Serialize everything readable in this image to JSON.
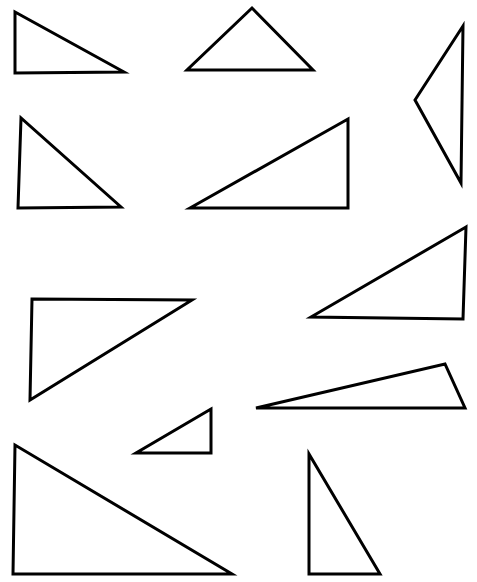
{
  "diagram": {
    "background": "#ffffff",
    "stroke_color": "#000000",
    "stroke_width": 3,
    "triangles": [
      {
        "id": "t1",
        "points": [
          [
            15,
            12
          ],
          [
            15,
            73
          ],
          [
            124,
            72
          ]
        ]
      },
      {
        "id": "t2",
        "points": [
          [
            252,
            8
          ],
          [
            187,
            70
          ],
          [
            313,
            70
          ]
        ]
      },
      {
        "id": "t3",
        "points": [
          [
            463,
            26
          ],
          [
            415,
            100
          ],
          [
            461,
            183
          ]
        ]
      },
      {
        "id": "t4",
        "points": [
          [
            21,
            118
          ],
          [
            18,
            208
          ],
          [
            121,
            207
          ]
        ]
      },
      {
        "id": "t5",
        "points": [
          [
            190,
            208
          ],
          [
            348,
            119
          ],
          [
            348,
            208
          ]
        ]
      },
      {
        "id": "t6",
        "points": [
          [
            466,
            227
          ],
          [
            311,
            317
          ],
          [
            463,
            319
          ]
        ]
      },
      {
        "id": "t7",
        "points": [
          [
            32,
            299
          ],
          [
            192,
            300
          ],
          [
            30,
            400
          ]
        ]
      },
      {
        "id": "t8",
        "points": [
          [
            256,
            408
          ],
          [
            445,
            364
          ],
          [
            465,
            408
          ]
        ]
      },
      {
        "id": "t9",
        "points": [
          [
            211,
            409
          ],
          [
            136,
            453
          ],
          [
            211,
            453
          ]
        ]
      },
      {
        "id": "t10",
        "points": [
          [
            15,
            445
          ],
          [
            13,
            574
          ],
          [
            232,
            574
          ]
        ]
      },
      {
        "id": "t11",
        "points": [
          [
            309,
            454
          ],
          [
            309,
            574
          ],
          [
            380,
            574
          ]
        ]
      }
    ]
  }
}
